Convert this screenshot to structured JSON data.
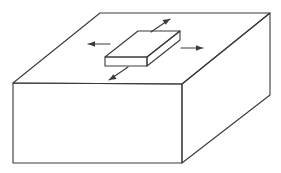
{
  "figure": {
    "title": "Thin slab resting on a rectangular block with four outward arrows",
    "caption": "",
    "background_color": "#ffffff",
    "line_color": "#3a3a3a",
    "face_color": "#ffffff",
    "line_width": 1.1,
    "width": 281,
    "height": 173
  },
  "base_block": {
    "name": "base-block",
    "label": "",
    "top_face": {
      "name": "base-top-face",
      "points": "13,83 100,13 270,13 182,84"
    },
    "front_face": {
      "name": "base-front-face",
      "points": "13,83 182,84 182,163 13,163"
    },
    "right_face": {
      "name": "base-right-face",
      "points": "182,84 270,13 270,95 182,163"
    },
    "vertices": {
      "top_front_left": [
        13,
        83
      ],
      "top_back_left": [
        100,
        13
      ],
      "top_back_right": [
        270,
        13
      ],
      "top_front_right": [
        182,
        84
      ],
      "bottom_front_left": [
        13,
        163
      ],
      "bottom_front_right": [
        182,
        163
      ],
      "bottom_back_right": [
        270,
        95
      ]
    }
  },
  "slab": {
    "name": "top-slab",
    "label": "",
    "top_face": {
      "name": "slab-top-face",
      "points": "105,57 138,31 180,31 147,57"
    },
    "front_face": {
      "name": "slab-front-face",
      "points": "105,57 147,57 147,66 105,66"
    },
    "right_face": {
      "name": "slab-right-face",
      "points": "147,57 180,31 180,40 147,66"
    },
    "vertices": {
      "top_front_left": [
        105,
        57
      ],
      "top_back_left": [
        138,
        31
      ],
      "top_back_right": [
        180,
        31
      ],
      "top_front_right": [
        147,
        57
      ],
      "bottom_front_left": [
        105,
        66
      ],
      "bottom_front_right": [
        147,
        66
      ],
      "bottom_back_right": [
        180,
        40
      ]
    }
  },
  "arrows": [
    {
      "name": "arrow-left",
      "direction": "left",
      "label": "",
      "from": [
        110,
        44
      ],
      "to": [
        88,
        44
      ],
      "head_points": "88,44 95,41.2 95,46.8"
    },
    {
      "name": "arrow-right",
      "direction": "right",
      "label": "",
      "from": [
        181,
        48
      ],
      "to": [
        203,
        48
      ],
      "head_points": "203,48 196,45.2 196,50.8"
    },
    {
      "name": "arrow-up-right",
      "direction": "up-right",
      "label": "",
      "from": [
        151,
        32
      ],
      "to": [
        170,
        19
      ],
      "head_points": "170,19 162.4,20.1 165.7,24.7"
    },
    {
      "name": "arrow-down-left",
      "direction": "down-left",
      "label": "",
      "from": [
        128,
        67
      ],
      "to": [
        109,
        80
      ],
      "head_points": "109,80 116.6,78.9 113.3,74.3"
    }
  ]
}
